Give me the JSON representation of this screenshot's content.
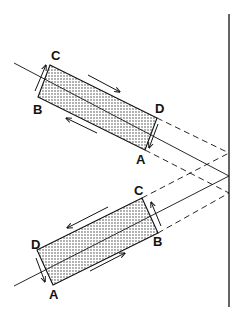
{
  "figure": {
    "colors": {
      "stroke": "#111111",
      "fill_dots": "#222222",
      "background": "#ffffff"
    },
    "upper_slab": {
      "labels": {
        "c": "C",
        "d": "D",
        "a": "A",
        "b": "B"
      },
      "arrows": [
        "right-along-top",
        "left-along-bottom",
        "up-at-left-end",
        "down-at-right-end"
      ]
    },
    "lower_slab": {
      "labels": {
        "c": "C",
        "b": "B",
        "d": "D",
        "a": "A"
      },
      "arrows": [
        "left-along-top",
        "right-along-bottom",
        "up-at-right-end",
        "down-at-left-end"
      ]
    },
    "mirror": {
      "orientation": "vertical"
    },
    "caption": ""
  }
}
